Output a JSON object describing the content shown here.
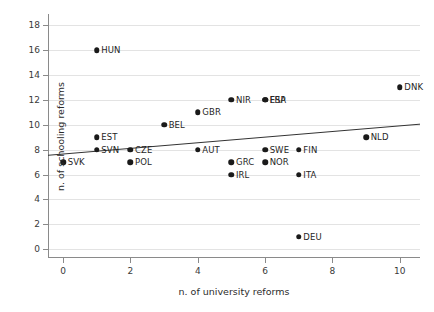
{
  "chart_data": {
    "type": "scatter",
    "title": "",
    "xlabel": "n. of university reforms",
    "ylabel": "n. of schooling reforms",
    "xlim": [
      -0.45,
      10.6
    ],
    "ylim": [
      -0.7,
      18.9
    ],
    "xticks": [
      0,
      2,
      4,
      6,
      8,
      10
    ],
    "xtick_labels": [
      "0",
      "2",
      "4",
      "6",
      "8",
      "10"
    ],
    "yticks": [
      0,
      2,
      4,
      6,
      8,
      10,
      12,
      14,
      16,
      18
    ],
    "ytick_labels": [
      "0",
      "2",
      "4",
      "6",
      "8",
      "10",
      "12",
      "14",
      "16",
      "18"
    ],
    "grid": "horizontal",
    "grid_color": "#e3e3e3",
    "point_color": "#1a1a1a",
    "trendline_color": "#333333",
    "legend": "none",
    "points": [
      {
        "label": "SVK",
        "x": 0,
        "y": 7,
        "label_side": "right"
      },
      {
        "label": "HUN",
        "x": 1,
        "y": 16,
        "label_side": "right"
      },
      {
        "label": "EST",
        "x": 1,
        "y": 9,
        "label_side": "right"
      },
      {
        "label": "SVN",
        "x": 1,
        "y": 8,
        "label_side": "right"
      },
      {
        "label": "CZE",
        "x": 2,
        "y": 8,
        "label_side": "right"
      },
      {
        "label": "POL",
        "x": 2,
        "y": 7,
        "label_side": "right"
      },
      {
        "label": "BEL",
        "x": 3,
        "y": 10,
        "label_side": "right"
      },
      {
        "label": "GBR",
        "x": 4,
        "y": 11,
        "label_side": "right"
      },
      {
        "label": "AUT",
        "x": 4,
        "y": 8,
        "label_side": "right"
      },
      {
        "label": "NIR",
        "x": 5,
        "y": 12,
        "label_side": "right"
      },
      {
        "label": "GRC",
        "x": 5,
        "y": 7,
        "label_side": "right"
      },
      {
        "label": "IRL",
        "x": 5,
        "y": 6,
        "label_side": "right"
      },
      {
        "label": "ESP",
        "x": 6,
        "y": 12,
        "label_side": "right"
      },
      {
        "label": "FRA",
        "x": 6,
        "y": 12,
        "label_side": "right"
      },
      {
        "label": "SWE",
        "x": 6,
        "y": 8,
        "label_side": "right"
      },
      {
        "label": "NOR",
        "x": 6,
        "y": 7,
        "label_side": "right"
      },
      {
        "label": "FIN",
        "x": 7,
        "y": 8,
        "label_side": "right"
      },
      {
        "label": "ITA",
        "x": 7,
        "y": 6,
        "label_side": "right"
      },
      {
        "label": "DEU",
        "x": 7,
        "y": 1,
        "label_side": "right"
      },
      {
        "label": "NLD",
        "x": 9,
        "y": 9,
        "label_side": "right"
      },
      {
        "label": "DNK",
        "x": 10,
        "y": 13,
        "label_side": "right"
      }
    ],
    "trendline": {
      "x0": -0.45,
      "y0": 7.55,
      "x1": 10.6,
      "y1": 10.05
    }
  }
}
